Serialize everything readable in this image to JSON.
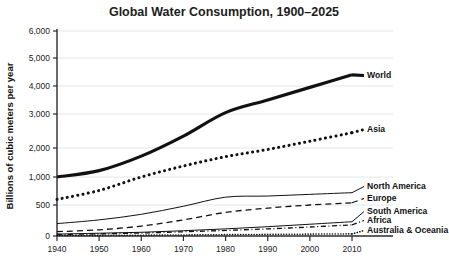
{
  "chart_data": {
    "type": "line",
    "title": "Global Water Consumption, 1900–2025",
    "xlabel": "",
    "ylabel": "Billions of cubic meters per year",
    "x": [
      1940,
      1950,
      1960,
      1970,
      1980,
      1990,
      2000,
      2010
    ],
    "xticks": [
      "1940",
      "1950",
      "1960",
      "1970",
      "1980",
      "1990",
      "2000",
      "2010"
    ],
    "yticks": [
      "0",
      "500",
      "1,000",
      "2,000",
      "3,000",
      "4,000",
      "5,000",
      "6,000"
    ],
    "ytick_values": [
      0,
      500,
      1000,
      2000,
      3000,
      4000,
      5000,
      6000
    ],
    "ylim": [
      0,
      6000
    ],
    "y_scale_note": "non-linear: expanded below 1,000",
    "grid": true,
    "legend_position": "right-inline",
    "series": [
      {
        "name": "World",
        "label": "World",
        "style": "solid-thick",
        "values": [
          1000,
          1220,
          1720,
          2350,
          3050,
          3500,
          3950,
          4400
        ]
      },
      {
        "name": "Asia",
        "label": "Asia",
        "style": "dotted",
        "values": [
          600,
          760,
          1000,
          1380,
          1700,
          1950,
          2200,
          2450
        ]
      },
      {
        "name": "North America",
        "label": "North America",
        "style": "solid-thin",
        "values": [
          200,
          260,
          350,
          480,
          640,
          660,
          690,
          720
        ]
      },
      {
        "name": "Europe",
        "label": "Europe",
        "style": "dashed",
        "values": [
          70,
          100,
          160,
          260,
          380,
          450,
          500,
          540
        ]
      },
      {
        "name": "South America",
        "label": "South America",
        "style": "solid-thin",
        "values": [
          30,
          45,
          60,
          85,
          115,
          150,
          190,
          230
        ]
      },
      {
        "name": "Africa",
        "label": "Africa",
        "style": "dash-dot",
        "values": [
          25,
          35,
          48,
          68,
          90,
          115,
          145,
          180
        ]
      },
      {
        "name": "Australia & Oceania",
        "label": "Australia & Oceania",
        "style": "dotted-fine",
        "values": [
          8,
          10,
          13,
          17,
          22,
          26,
          30,
          34
        ]
      }
    ]
  }
}
